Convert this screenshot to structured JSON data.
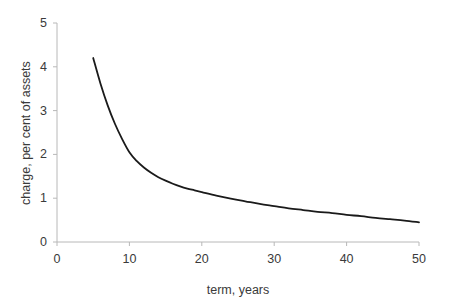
{
  "chart_data": {
    "type": "line",
    "title": "",
    "xlabel": "term, years",
    "ylabel": "charge, per cent of assets",
    "xlim": [
      0,
      50
    ],
    "ylim": [
      0,
      5
    ],
    "xticks": [
      0,
      10,
      20,
      30,
      40,
      50
    ],
    "yticks": [
      0,
      1,
      2,
      3,
      4,
      5
    ],
    "xtick_labels": [
      "0",
      "10",
      "20",
      "30",
      "40",
      "50"
    ],
    "ytick_labels": [
      "0",
      "1",
      "2",
      "3",
      "4",
      "5"
    ],
    "grid": false,
    "legend": false,
    "series": [
      {
        "name": "charge",
        "color": "#1a1a1a",
        "line_width": 1.8,
        "x": [
          5,
          6,
          7,
          8,
          9,
          10,
          11,
          12,
          13,
          14,
          15,
          16,
          17,
          18,
          19,
          20,
          22,
          24,
          26,
          28,
          30,
          32,
          34,
          36,
          38,
          40,
          42,
          44,
          46,
          48,
          50
        ],
        "values": [
          4.2,
          3.62,
          3.12,
          2.7,
          2.35,
          2.05,
          1.85,
          1.7,
          1.58,
          1.48,
          1.4,
          1.33,
          1.27,
          1.22,
          1.18,
          1.14,
          1.06,
          0.99,
          0.93,
          0.87,
          0.82,
          0.77,
          0.73,
          0.69,
          0.66,
          0.62,
          0.59,
          0.55,
          0.52,
          0.49,
          0.45
        ]
      }
    ]
  },
  "axes": {
    "x_axis_name": "x-axis",
    "y_axis_name": "y-axis",
    "axis_color": "#b8b8b8"
  }
}
